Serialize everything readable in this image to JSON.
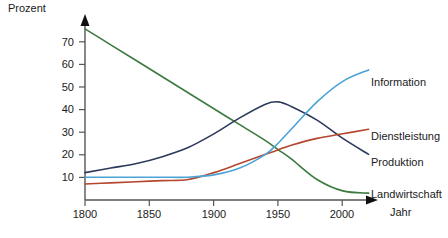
{
  "chart_data": {
    "type": "line",
    "title": "",
    "xlabel": "Jahr",
    "ylabel": "Prozent",
    "xlim": [
      1800,
      2020
    ],
    "ylim": [
      0,
      78
    ],
    "grid": false,
    "legend_position": "right-inline-labels",
    "xticks": [
      "1800",
      "1850",
      "1900",
      "1950",
      "2000"
    ],
    "xtick_values": [
      1800,
      1850,
      1900,
      1950,
      2000
    ],
    "yticks": [
      "10",
      "20",
      "30",
      "40",
      "50",
      "60",
      "70"
    ],
    "ytick_values": [
      10,
      20,
      30,
      40,
      50,
      60,
      70
    ],
    "x": [
      1800,
      1820,
      1840,
      1860,
      1880,
      1900,
      1920,
      1940,
      1950,
      1960,
      1980,
      2000,
      2020
    ],
    "series": [
      {
        "name": "Landwirtschaft",
        "color": "#3d7a3f",
        "values": [
          75,
          68,
          61,
          54,
          47,
          40,
          33,
          26,
          22,
          18,
          9,
          4,
          3
        ]
      },
      {
        "name": "Produktion",
        "color": "#2d3a5c",
        "values": [
          12,
          14,
          16,
          19,
          23,
          29,
          36,
          42,
          43,
          41,
          35,
          27,
          20
        ]
      },
      {
        "name": "Dienstleistung",
        "color": "#b4472e",
        "values": [
          7,
          7.5,
          8,
          8.5,
          9,
          12,
          16,
          20,
          22,
          24,
          27,
          29,
          31
        ]
      },
      {
        "name": "Information",
        "color": "#4ba3d6",
        "values": [
          10,
          10,
          10,
          10,
          10,
          11,
          14,
          20,
          25,
          31,
          43,
          52,
          57
        ]
      }
    ]
  },
  "labels": {
    "information": "Information",
    "dienstleistung": "Dienstleistung",
    "produktion": "Produktion",
    "landwirtschaft": "Landwirtschaft",
    "y_axis": "Prozent",
    "x_axis": "Jahr"
  },
  "xticks": {
    "t0": "1800",
    "t1": "1850",
    "t2": "1900",
    "t3": "1950",
    "t4": "2000"
  },
  "yticks": {
    "t10": "10",
    "t20": "20",
    "t30": "30",
    "t40": "40",
    "t50": "50",
    "t60": "60",
    "t70": "70"
  },
  "colors": {
    "landwirtschaft": "#3d7a3f",
    "produktion": "#2d3a5c",
    "dienstleistung": "#b4472e",
    "information": "#4ba3d6",
    "axis": "#555555",
    "text": "#1a1a1a"
  }
}
